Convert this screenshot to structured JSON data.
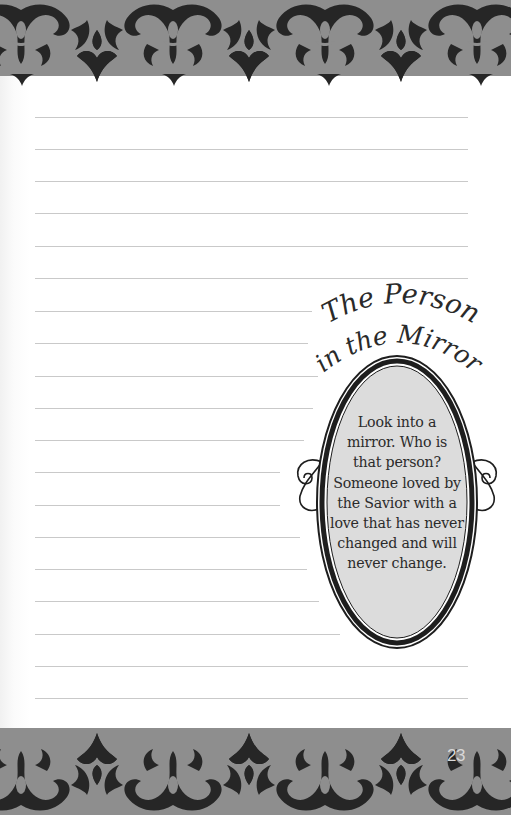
{
  "page": {
    "number": "23",
    "background_color": "#ffffff",
    "border_colors": {
      "band": "#8e8e8e",
      "pattern": "#262626"
    }
  },
  "journal_lines": {
    "count": 19,
    "color": "#c9c9c9",
    "lines": [
      {
        "y": 117,
        "right": 468
      },
      {
        "y": 149,
        "right": 468
      },
      {
        "y": 181,
        "right": 468
      },
      {
        "y": 213,
        "right": 468
      },
      {
        "y": 246,
        "right": 468
      },
      {
        "y": 278,
        "right": 468
      },
      {
        "y": 311,
        "right": 312
      },
      {
        "y": 343,
        "right": 308
      },
      {
        "y": 376,
        "right": 318
      },
      {
        "y": 408,
        "right": 313
      },
      {
        "y": 440,
        "right": 304
      },
      {
        "y": 472,
        "right": 280
      },
      {
        "y": 505,
        "right": 280
      },
      {
        "y": 537,
        "right": 300
      },
      {
        "y": 569,
        "right": 307
      },
      {
        "y": 601,
        "right": 319
      },
      {
        "y": 634,
        "right": 340
      },
      {
        "y": 666,
        "right": 468
      },
      {
        "y": 698,
        "right": 468
      }
    ]
  },
  "sidebar_feature": {
    "title_line1": "The Person",
    "title_line2": "in the Mirror",
    "body_lines": [
      "Look into a",
      "mirror. Who is",
      "that person?",
      "Someone loved by",
      "the Savior with a",
      "love that has never",
      "changed and will",
      "never change."
    ],
    "mirror_fill": "#dcdcdc",
    "frame_color": "#1e1e1e"
  }
}
